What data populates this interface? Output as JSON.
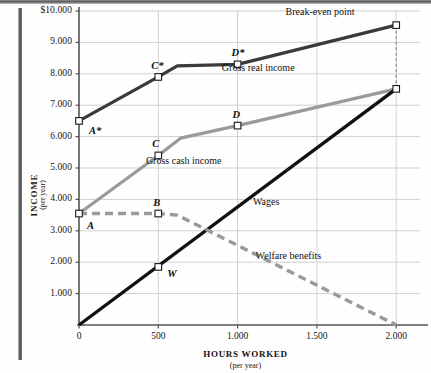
{
  "chart_data": {
    "type": "line",
    "title": "",
    "xlabel": "HOURS WORKED",
    "xlabel_sub": "(per year)",
    "ylabel": "INCOME",
    "ylabel_sub": "(per year)",
    "xlim": [
      0,
      2150
    ],
    "ylim": [
      0,
      10000
    ],
    "grid": true,
    "legend_position": "inline-labels",
    "xticks": [
      {
        "value": 0,
        "label": "0"
      },
      {
        "value": 500,
        "label": "500"
      },
      {
        "value": 1000,
        "label": "1.000"
      },
      {
        "value": 1500,
        "label": "1.500"
      },
      {
        "value": 2000,
        "label": "2.000"
      }
    ],
    "yticks": [
      {
        "value": 1000,
        "label": "1.000"
      },
      {
        "value": 2000,
        "label": "2.000"
      },
      {
        "value": 3000,
        "label": "3.000"
      },
      {
        "value": 4000,
        "label": "4.000"
      },
      {
        "value": 5000,
        "label": "5.000"
      },
      {
        "value": 6000,
        "label": "6.000"
      },
      {
        "value": 7000,
        "label": "7.000"
      },
      {
        "value": 8000,
        "label": "8.000"
      },
      {
        "value": 9000,
        "label": "9.000"
      },
      {
        "value": 10000,
        "label": "$10.000"
      }
    ],
    "series": [
      {
        "name": "Gross real income",
        "color": "#3a3a3a",
        "style": "solid",
        "width": 3.2,
        "points": [
          {
            "x": 0,
            "y": 6500
          },
          {
            "x": 500,
            "y": 7900
          },
          {
            "x": 620,
            "y": 8250
          },
          {
            "x": 1000,
            "y": 8300
          },
          {
            "x": 2000,
            "y": 9550
          }
        ],
        "markers": [
          {
            "x": 0,
            "y": 6500,
            "label": "A*"
          },
          {
            "x": 500,
            "y": 7900,
            "label": "C*"
          },
          {
            "x": 1000,
            "y": 8300,
            "label": "D*"
          },
          {
            "x": 2000,
            "y": 9550,
            "label": ""
          }
        ]
      },
      {
        "name": "Gross cash income",
        "color": "#9a9a9a",
        "style": "solid",
        "width": 3.2,
        "points": [
          {
            "x": 0,
            "y": 3550
          },
          {
            "x": 500,
            "y": 5400
          },
          {
            "x": 640,
            "y": 5950
          },
          {
            "x": 1000,
            "y": 6350
          },
          {
            "x": 2000,
            "y": 7520
          }
        ],
        "markers": [
          {
            "x": 0,
            "y": 3550,
            "label": "A"
          },
          {
            "x": 500,
            "y": 5400,
            "label": "C"
          },
          {
            "x": 1000,
            "y": 6350,
            "label": "D"
          }
        ]
      },
      {
        "name": "Wages",
        "color": "#111111",
        "style": "solid",
        "width": 3.4,
        "points": [
          {
            "x": 0,
            "y": 0
          },
          {
            "x": 2000,
            "y": 7520
          }
        ],
        "markers": [
          {
            "x": 500,
            "y": 1850,
            "label": "W"
          },
          {
            "x": 2000,
            "y": 7520,
            "label": ""
          }
        ]
      },
      {
        "name": "Welfare benefits",
        "color": "#9a9a9a",
        "style": "dashed",
        "width": 3.4,
        "points": [
          {
            "x": 0,
            "y": 3550
          },
          {
            "x": 500,
            "y": 3550
          },
          {
            "x": 620,
            "y": 3500
          },
          {
            "x": 2000,
            "y": 0
          }
        ],
        "markers": [
          {
            "x": 500,
            "y": 3550,
            "label": "B"
          }
        ]
      }
    ],
    "annotations": [
      {
        "text": "Break-even point",
        "x": 1520,
        "y": 9950
      },
      {
        "text": "Gross real income",
        "x": 1130,
        "y": 8150
      },
      {
        "text": "Gross cash income",
        "x": 660,
        "y": 5200
      },
      {
        "text": "Wages",
        "x": 1180,
        "y": 3900
      },
      {
        "text": "Welfare benefits",
        "x": 1320,
        "y": 2150
      }
    ],
    "point_labels": [
      {
        "text": "A*",
        "x": 0,
        "y": 6500,
        "dx": 10,
        "dy": 11
      },
      {
        "text": "A",
        "x": 0,
        "y": 3550,
        "dx": 8,
        "dy": 13
      },
      {
        "text": "C*",
        "x": 500,
        "y": 7900,
        "dx": -7,
        "dy": -10
      },
      {
        "text": "C",
        "x": 500,
        "y": 5400,
        "dx": -6,
        "dy": -10
      },
      {
        "text": "D*",
        "x": 1000,
        "y": 8300,
        "dx": -6,
        "dy": -10
      },
      {
        "text": "D",
        "x": 1000,
        "y": 6350,
        "dx": -5,
        "dy": -10
      },
      {
        "text": "B",
        "x": 500,
        "y": 3550,
        "dx": -5,
        "dy": -10
      },
      {
        "text": "W",
        "x": 500,
        "y": 1850,
        "dx": 9,
        "dy": 8
      }
    ],
    "dropline": {
      "x": 2000,
      "y_top": 9550,
      "y_bottom": 7520,
      "style": "dashed",
      "color": "#888888"
    },
    "colors": {
      "dark_line": "#3a3a3a",
      "gray_line": "#9a9a9a",
      "black_line": "#111111",
      "grid": "#cccccc",
      "axis": "#555555",
      "background": "#fefefe"
    }
  }
}
